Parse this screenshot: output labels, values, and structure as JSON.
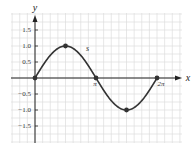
{
  "chart_data": {
    "type": "line",
    "title": "",
    "xlabel": "x",
    "ylabel": "y",
    "series": [
      {
        "name": "s",
        "function": "sin(x)",
        "x": [
          0,
          0.3927,
          0.7854,
          1.1781,
          1.5708,
          1.9635,
          2.3562,
          2.7489,
          3.1416,
          3.5343,
          3.927,
          4.3197,
          4.7124,
          5.1051,
          5.4978,
          5.8905,
          6.2832
        ],
        "values": [
          0,
          0.383,
          0.707,
          0.924,
          1.0,
          0.924,
          0.707,
          0.383,
          0,
          -0.383,
          -0.707,
          -0.924,
          -1.0,
          -0.924,
          -0.707,
          -0.383,
          0
        ]
      }
    ],
    "marked_points": [
      {
        "x": 0,
        "y": 0
      },
      {
        "x": 1.5708,
        "y": 1.0
      },
      {
        "x": 3.1416,
        "y": 0
      },
      {
        "x": 4.7124,
        "y": -1.0
      },
      {
        "x": 6.2832,
        "y": 0
      }
    ],
    "x_tick_labels": [
      {
        "value": 3.1416,
        "label": "π"
      },
      {
        "value": 6.2832,
        "label": "2π"
      }
    ],
    "y_tick_labels": [
      {
        "value": 1.5,
        "label": "1.5"
      },
      {
        "value": 1.0,
        "label": "1.0"
      },
      {
        "value": 0.5,
        "label": "0.5"
      },
      {
        "value": -0.5,
        "label": "−0.5"
      },
      {
        "value": -1.0,
        "label": "−1.0"
      },
      {
        "value": -1.5,
        "label": "−1.5"
      }
    ],
    "xlim": [
      -3.0,
      7.5
    ],
    "ylim": [
      -2.0,
      2.0
    ],
    "grid": true,
    "legend": "none",
    "annotations": [
      {
        "text": "s",
        "x": 2.6,
        "y": 0.85
      }
    ]
  },
  "layout": {
    "origin_px": [
      35,
      78
    ],
    "px_per_x_unit": 19.42,
    "px_per_y_unit": 32,
    "grid_box": [
      11,
      13,
      182,
      143
    ],
    "curve_color": "#333333",
    "grid_color": "#dddddd",
    "axis_color": "#222222"
  }
}
